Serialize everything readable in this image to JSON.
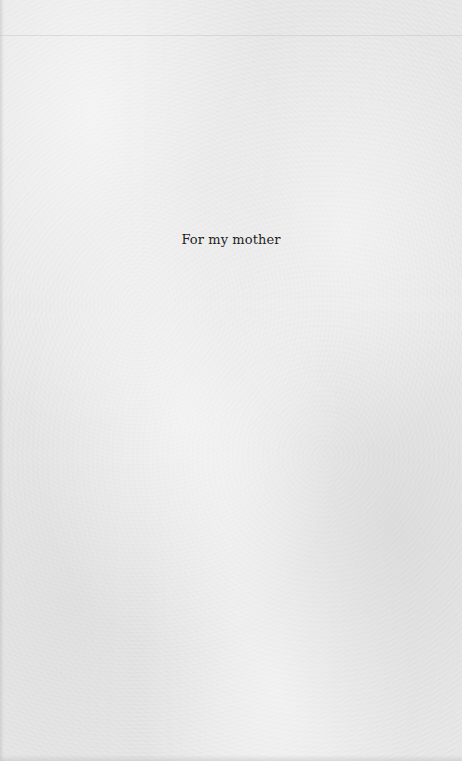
{
  "page": {
    "type": "dedication",
    "text": "For my mother",
    "colors": {
      "background": "#e8e8e8",
      "text": "#1e1e1e"
    }
  }
}
